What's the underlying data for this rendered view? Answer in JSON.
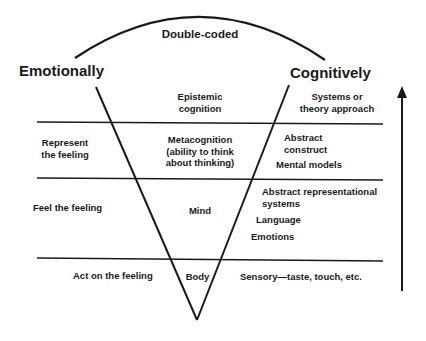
{
  "title": "Double-coded",
  "left_header": "Emotionally",
  "right_header": "Cognitively",
  "rows": [
    {
      "left": "",
      "center": "Epistemic\ncognition",
      "right": [
        "Systems or\ntheory approach"
      ]
    },
    {
      "left": "Represent\nthe feeling",
      "center": "Metacognition\n(ability to think\nabout thinking)",
      "right": [
        "Abstract\nconstruct",
        "Mental models"
      ]
    },
    {
      "left": "Feel the feeling",
      "center": "Mind",
      "right": [
        "Abstract representational\nsystems",
        "Language",
        "Emotions"
      ]
    },
    {
      "left": "Act on the feeling",
      "center": "Body",
      "right": [
        "Sensory—taste, touch, etc."
      ]
    }
  ],
  "arrow": {
    "direction": "up"
  },
  "colors": {
    "line": "#1a1a1a",
    "background": "#ffffff"
  }
}
